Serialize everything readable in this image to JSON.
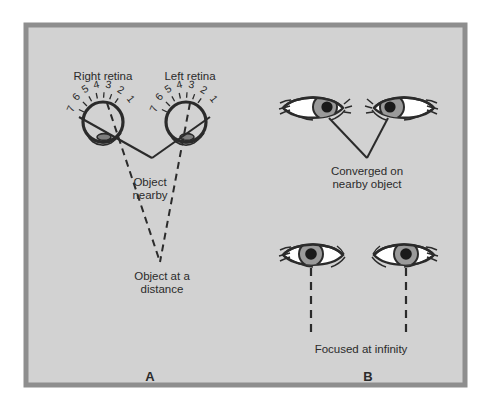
{
  "figure": {
    "background_color": "#ffffff",
    "panel_fill": "#d2d2d2",
    "panel_border_color": "#8e8e8e",
    "ink_color": "#2b2b2b",
    "iris_color": "#9a9a9a",
    "sclera_color": "#ffffff",
    "pupil_color": "#1a1a1a"
  },
  "panel_a": {
    "id": "A",
    "label_right_retina": "Right retina",
    "label_left_retina": "Left retina",
    "label_object_nearby_line1": "Object",
    "label_object_nearby_line2": "nearby",
    "label_object_distance_line1": "Object at a",
    "label_object_distance_line2": "distance",
    "retina_scale_numbers": [
      "7",
      "6",
      "5",
      "4",
      "3",
      "2",
      "1"
    ],
    "right_eye": {
      "center_x": 103,
      "center_y": 122,
      "radius": 20
    },
    "left_eye": {
      "center_x": 186,
      "center_y": 122,
      "radius": 20
    },
    "near_object_point": {
      "x": 152,
      "y": 158
    },
    "far_object_point": {
      "x": 160,
      "y": 262
    }
  },
  "panel_b": {
    "id": "B",
    "caption_converged_line1": "Converged on",
    "caption_converged_line2": "nearby object",
    "caption_infinity": "Focused at infinity",
    "converged_pair": {
      "left_eye_x": 313,
      "right_eye_x": 404,
      "eye_y": 108,
      "convergence_x": 367,
      "convergence_y": 158,
      "gaze": "converged-inward"
    },
    "infinity_pair": {
      "left_eye_x": 313,
      "right_eye_x": 404,
      "eye_y": 255,
      "gaze": "parallel-straight-ahead",
      "line_end_y": 333
    }
  }
}
